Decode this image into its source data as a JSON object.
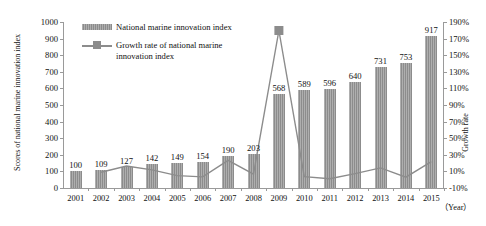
{
  "chart_data": {
    "type": "bar",
    "title": "",
    "xlabel": "（Year）",
    "ylabel": "Scores of national marine innovation index",
    "y2label": "Growth rate",
    "categories": [
      "2001",
      "2002",
      "2003",
      "2004",
      "2005",
      "2006",
      "2007",
      "2008",
      "2009",
      "2010",
      "2011",
      "2012",
      "2013",
      "2014",
      "2015"
    ],
    "ylim": [
      0,
      1000
    ],
    "y2lim": [
      -10,
      190
    ],
    "yticks": [
      0,
      100,
      200,
      300,
      400,
      500,
      600,
      700,
      800,
      900,
      1000
    ],
    "y2ticks": [
      "-10%",
      "10%",
      "30%",
      "50%",
      "70%",
      "90%",
      "110%",
      "130%",
      "150%",
      "170%",
      "190%"
    ],
    "grid": false,
    "legend_position": "top-left",
    "series": [
      {
        "name": "National marine innovation index",
        "type": "bar",
        "color": "#8c8c8c",
        "values": [
          100,
          109,
          127,
          142,
          149,
          154,
          190,
          203,
          568,
          589,
          596,
          640,
          731,
          753,
          917
        ],
        "labels": [
          "100",
          "109",
          "127",
          "142",
          "149",
          "154",
          "190",
          "203",
          "568",
          "589",
          "596",
          "640",
          "731",
          "753",
          "917"
        ]
      },
      {
        "name": "Growth rate of national marine innovation index",
        "type": "line",
        "color": "#8c8c8c",
        "axis": "right",
        "values": [
          null,
          9,
          16.5,
          11.8,
          4.9,
          3.4,
          23.4,
          6.8,
          179.8,
          3.7,
          1.2,
          7.4,
          14.2,
          3.0,
          21.8
        ]
      }
    ]
  },
  "legend": {
    "items": [
      {
        "label": "National marine innovation index"
      },
      {
        "label": "Growth rate of national marine\ninnovation index"
      }
    ]
  }
}
